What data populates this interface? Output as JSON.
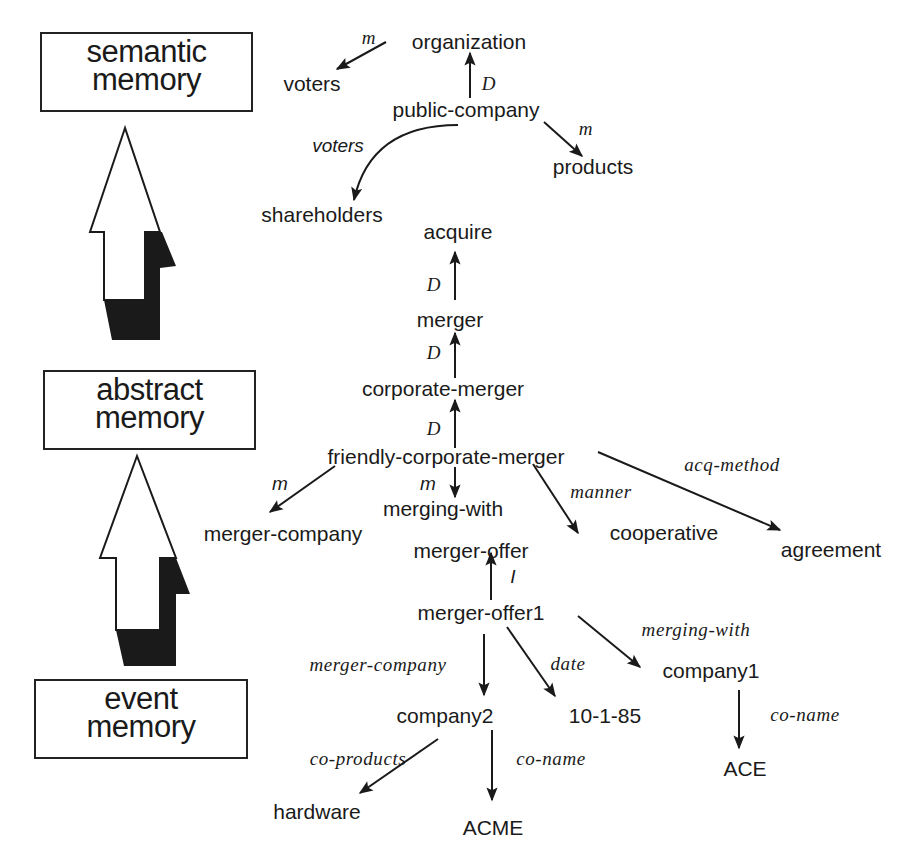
{
  "memory_levels": [
    {
      "id": "semantic",
      "line1": "semantic",
      "line2": "memory"
    },
    {
      "id": "abstract",
      "line1": "abstract",
      "line2": "memory"
    },
    {
      "id": "event",
      "line1": "event",
      "line2": "memory"
    }
  ],
  "nodes": {
    "organization": "organization",
    "voters": "voters",
    "public_company": "public-company",
    "products": "products",
    "shareholders": "shareholders",
    "acquire": "acquire",
    "merger": "merger",
    "corporate_merger": "corporate-merger",
    "friendly_corporate_merger": "friendly-corporate-merger",
    "merger_company": "merger-company",
    "merging_with": "merging-with",
    "cooperative": "cooperative",
    "agreement": "agreement",
    "merger_offer": "merger-offer",
    "merger_offer1": "merger-offer1",
    "company2": "company2",
    "date_value": "10-1-85",
    "company1": "company1",
    "hardware": "hardware",
    "acme": "ACME",
    "ace": "ACE"
  },
  "edges": [
    {
      "from": "organization",
      "to": "voters",
      "label": "m"
    },
    {
      "from": "public-company",
      "to": "organization",
      "label": "D"
    },
    {
      "from": "public-company",
      "to": "products",
      "label": "m"
    },
    {
      "from": "public-company",
      "to": "shareholders",
      "label": "voters"
    },
    {
      "from": "merger",
      "to": "acquire",
      "label": "D"
    },
    {
      "from": "corporate-merger",
      "to": "merger",
      "label": "D"
    },
    {
      "from": "friendly-corporate-merger",
      "to": "corporate-merger",
      "label": "D"
    },
    {
      "from": "friendly-corporate-merger",
      "to": "merger-company",
      "label": "m"
    },
    {
      "from": "friendly-corporate-merger",
      "to": "merging-with",
      "label": "m"
    },
    {
      "from": "friendly-corporate-merger",
      "to": "cooperative",
      "label": "manner"
    },
    {
      "from": "friendly-corporate-merger",
      "to": "agreement",
      "label": "acq-method"
    },
    {
      "from": "merger-offer1",
      "to": "merger-offer",
      "label": "I"
    },
    {
      "from": "merger-offer1",
      "to": "company2",
      "label": "merger-company"
    },
    {
      "from": "merger-offer1",
      "to": "10-1-85",
      "label": "date"
    },
    {
      "from": "merger-offer1",
      "to": "company1",
      "label": "merging-with"
    },
    {
      "from": "company2",
      "to": "hardware",
      "label": "co-products"
    },
    {
      "from": "company2",
      "to": "ACME",
      "label": "co-name"
    },
    {
      "from": "company1",
      "to": "ACE",
      "label": "co-name"
    }
  ],
  "edge_labels": {
    "org_voters": "m",
    "pc_org": "D",
    "pc_products": "m",
    "pc_shareholders": "voters",
    "merger_acquire": "D",
    "cm_merger": "D",
    "fcm_cm": "D",
    "fcm_mc": "m",
    "fcm_mw": "m",
    "fcm_coop": "manner",
    "fcm_agree": "acq-method",
    "mo1_mo": "I",
    "mo1_c2": "merger-company",
    "mo1_date": "date",
    "mo1_c1": "merging-with",
    "c2_hw": "co-products",
    "c2_acme": "co-name",
    "c1_ace": "co-name"
  },
  "colors": {
    "ink": "#1a1a1a",
    "background": "#ffffff"
  }
}
